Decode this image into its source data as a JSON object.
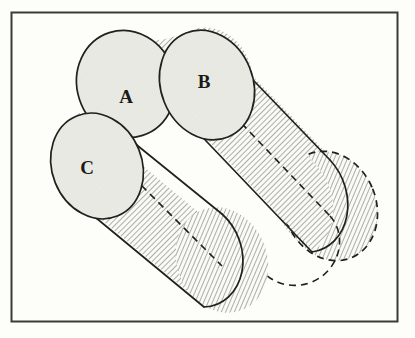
{
  "figure": {
    "background_color": "#fdfdfa",
    "frame": {
      "name": "outer-frame",
      "x": 11,
      "y": 12,
      "width": 387,
      "height": 310,
      "stroke_color": "#3a3a36",
      "stroke_width": 2,
      "fill": "#fdfdfa"
    },
    "style": {
      "outline_color": "#20201c",
      "outline_width": 1.6,
      "hidden_edge_color": "#20201c",
      "hidden_edge_dash": "7,5",
      "ellipse_fill": "#e9e9e4",
      "hatch_color": "#70706a",
      "hatch_background": "#fafaf6",
      "hatch_angle_degrees": 45,
      "hatch_spacing": 4
    },
    "labels": [
      {
        "id": "A",
        "text": "A",
        "x": 126,
        "y": 103
      },
      {
        "id": "B",
        "text": "B",
        "x": 204,
        "y": 88
      },
      {
        "id": "C",
        "text": "C",
        "x": 87,
        "y": 174
      }
    ],
    "shapes": [
      {
        "name": "upper-cylinder",
        "type": "cylinder",
        "axis_angle_degrees": 31,
        "front_face_label": "B",
        "body_fill": "hatched",
        "back_face_visible": "dashed",
        "front_ellipse": {
          "cx": 207,
          "cy": 85,
          "rx": 45,
          "ry": 55,
          "rotation": -22
        },
        "back_ellipse": {
          "cx": 330,
          "cy": 215,
          "rx": 45,
          "ry": 55,
          "rotation": -22
        }
      },
      {
        "name": "lower-cylinder",
        "type": "cylinder",
        "axis_angle_degrees": 31,
        "front_face_label": "C",
        "body_fill": "hatched",
        "back_face_visible": "dashed",
        "front_ellipse": {
          "cx": 97,
          "cy": 166,
          "rx": 44,
          "ry": 53,
          "rotation": -22
        },
        "back_ellipse": {
          "cx": 222,
          "cy": 270,
          "rx": 44,
          "ry": 53,
          "rotation": -22
        }
      },
      {
        "name": "ellipse-a",
        "type": "ellipse",
        "label": "A",
        "fill": "#e9e9e4",
        "cx": 126,
        "cy": 84,
        "rx": 48,
        "ry": 53,
        "rotation": -18
      }
    ]
  }
}
